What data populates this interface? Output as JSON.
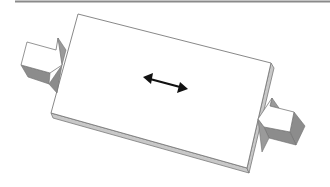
{
  "diagram": {
    "colors": {
      "background": "#ffffff",
      "rule": "#8a8a8a",
      "outline": "#7a7a7a",
      "top_face": "#ffffff",
      "slab_edge": "#c8c8c8",
      "block_side_dark": "#8c8c8c",
      "block_side_mid": "#a4a4a4",
      "arrow": "#111111"
    },
    "elements": {
      "top_rule": "horizontal-rule",
      "slab": "rectangular-slab",
      "left_block": "left-push-block",
      "right_block": "right-push-block",
      "direction_arrow": "double-headed-arrow"
    }
  }
}
